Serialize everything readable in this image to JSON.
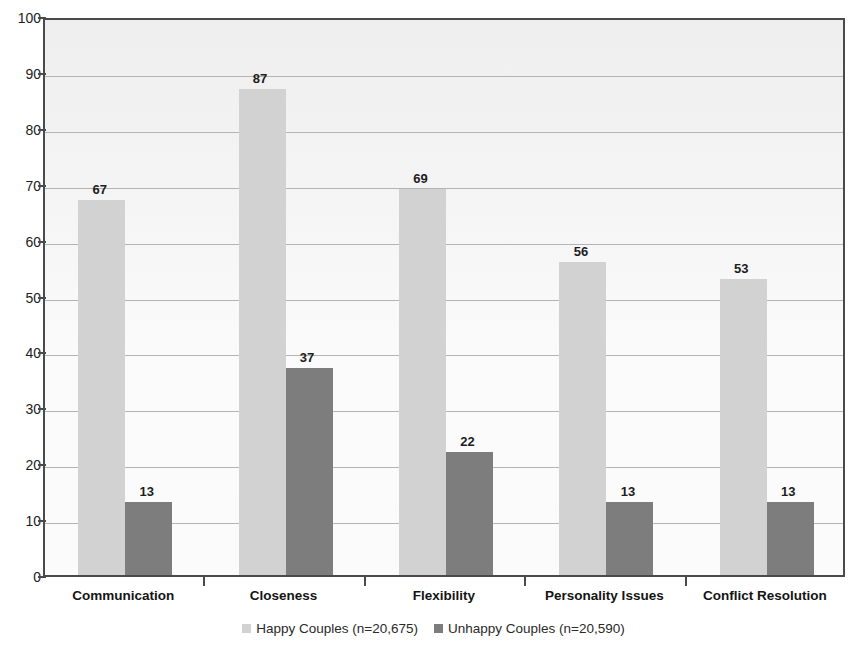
{
  "chart_data": {
    "type": "bar",
    "title": "",
    "subtitle": "",
    "xlabel": "",
    "ylabel": "",
    "ylim": [
      0,
      100
    ],
    "ytick_step": 10,
    "yticks": [
      100,
      90,
      80,
      70,
      60,
      50,
      40,
      30,
      20,
      10,
      0
    ],
    "grid": true,
    "grid_axis": "y",
    "legend_position": "bottom-center",
    "categories": [
      "Communication",
      "Closeness",
      "Flexibility",
      "Personality Issues",
      "Conflict Resolution"
    ],
    "series": [
      {
        "name": "Happy Couples (n=20,675)",
        "color": "#d2d2d2",
        "values": [
          67,
          87,
          69,
          56,
          53
        ]
      },
      {
        "name": "Unhappy Couples (n=20,590)",
        "color": "#7d7d7d",
        "values": [
          13,
          37,
          22,
          13,
          13
        ]
      }
    ],
    "data_labels": true
  },
  "legend": {
    "items": [
      {
        "label": "Happy Couples (n=20,675)",
        "swatch": "happy"
      },
      {
        "label": "Unhappy Couples (n=20,590)",
        "swatch": "unhappy"
      }
    ]
  },
  "colors": {
    "happy": "#d2d2d2",
    "unhappy": "#7d7d7d",
    "axis": "#4a4a4a",
    "gridline": "#b4b4b4",
    "plot_background": "#fbfbfb",
    "text": "#1d1d1d"
  }
}
